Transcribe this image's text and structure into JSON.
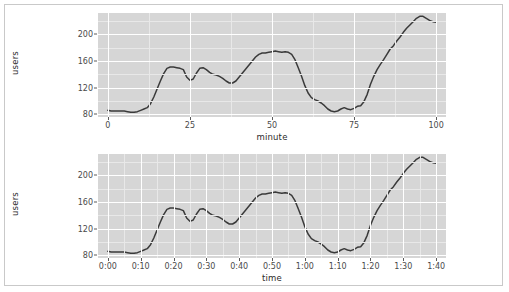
{
  "figure": {
    "background_color": "#ffffff",
    "border_color": "#c9c9c9",
    "panel_color": "#d6d6d6",
    "grid_major_color": "#ffffff",
    "grid_minor_color": "#e8e8e8",
    "line_color": "#3a3a3a"
  },
  "chart_data": [
    {
      "type": "line",
      "title": "",
      "xlabel": "minute",
      "ylabel": "users",
      "xlim": [
        -3,
        103
      ],
      "ylim": [
        76,
        232
      ],
      "grid": true,
      "legend": "none",
      "xticks": [
        "0",
        "25",
        "50",
        "75",
        "100"
      ],
      "xtick_values": [
        0,
        25,
        50,
        75,
        100
      ],
      "yticks": [
        "80",
        "120",
        "160",
        "200"
      ],
      "ytick_values": [
        80,
        120,
        160,
        200
      ],
      "series": [
        {
          "name": "users",
          "color": "#3a3a3a",
          "x": [
            0,
            1,
            2,
            3,
            4,
            5,
            6,
            7,
            8,
            9,
            10,
            11,
            12,
            13,
            14,
            15,
            16,
            17,
            18,
            19,
            20,
            21,
            22,
            23,
            24,
            25,
            26,
            27,
            28,
            29,
            30,
            31,
            32,
            33,
            34,
            35,
            36,
            37,
            38,
            39,
            40,
            41,
            42,
            43,
            44,
            45,
            46,
            47,
            48,
            49,
            50,
            51,
            52,
            53,
            54,
            55,
            56,
            57,
            58,
            59,
            60,
            61,
            62,
            63,
            64,
            65,
            66,
            67,
            68,
            69,
            70,
            71,
            72,
            73,
            74,
            75,
            76,
            77,
            78,
            79,
            80,
            81,
            82,
            83,
            84,
            85,
            86,
            87,
            88,
            89,
            90,
            91,
            92,
            93,
            94,
            95,
            96,
            97,
            98,
            99,
            100
          ],
          "y": [
            86,
            85,
            85,
            85,
            85,
            85,
            84,
            83,
            83,
            84,
            86,
            88,
            90,
            96,
            106,
            118,
            130,
            141,
            149,
            151,
            151,
            150,
            149,
            147,
            136,
            131,
            133,
            142,
            149,
            150,
            147,
            143,
            140,
            139,
            137,
            134,
            130,
            127,
            127,
            130,
            136,
            142,
            148,
            154,
            160,
            166,
            170,
            172,
            172,
            173,
            174,
            175,
            174,
            173,
            174,
            173,
            170,
            162,
            150,
            137,
            123,
            112,
            105,
            102,
            100,
            97,
            93,
            88,
            85,
            84,
            85,
            88,
            90,
            88,
            87,
            89,
            92,
            93,
            99,
            110,
            125,
            137,
            147,
            155,
            162,
            170,
            178,
            183,
            190,
            196,
            203,
            209,
            214,
            219,
            224,
            227,
            227,
            224,
            221,
            219,
            218
          ]
        }
      ]
    },
    {
      "type": "line",
      "title": "",
      "xlabel": "time",
      "ylabel": "users",
      "xlim": [
        -3,
        103
      ],
      "ylim": [
        76,
        232
      ],
      "grid": true,
      "legend": "none",
      "xticks": [
        "0:00",
        "0:10",
        "0:20",
        "0:30",
        "0:40",
        "0:50",
        "1:00",
        "1:10",
        "1:20",
        "1:30",
        "1:40"
      ],
      "xtick_values": [
        0,
        10,
        20,
        30,
        40,
        50,
        60,
        70,
        80,
        90,
        100
      ],
      "yticks": [
        "80",
        "120",
        "160",
        "200"
      ],
      "ytick_values": [
        80,
        120,
        160,
        200
      ],
      "series": [
        {
          "name": "users",
          "color": "#3a3a3a",
          "x": [
            0,
            1,
            2,
            3,
            4,
            5,
            6,
            7,
            8,
            9,
            10,
            11,
            12,
            13,
            14,
            15,
            16,
            17,
            18,
            19,
            20,
            21,
            22,
            23,
            24,
            25,
            26,
            27,
            28,
            29,
            30,
            31,
            32,
            33,
            34,
            35,
            36,
            37,
            38,
            39,
            40,
            41,
            42,
            43,
            44,
            45,
            46,
            47,
            48,
            49,
            50,
            51,
            52,
            53,
            54,
            55,
            56,
            57,
            58,
            59,
            60,
            61,
            62,
            63,
            64,
            65,
            66,
            67,
            68,
            69,
            70,
            71,
            72,
            73,
            74,
            75,
            76,
            77,
            78,
            79,
            80,
            81,
            82,
            83,
            84,
            85,
            86,
            87,
            88,
            89,
            90,
            91,
            92,
            93,
            94,
            95,
            96,
            97,
            98,
            99,
            100
          ],
          "y": [
            86,
            85,
            85,
            85,
            85,
            85,
            84,
            83,
            83,
            84,
            86,
            88,
            90,
            96,
            106,
            118,
            130,
            141,
            149,
            151,
            151,
            150,
            149,
            147,
            136,
            131,
            133,
            142,
            149,
            150,
            147,
            143,
            140,
            139,
            137,
            134,
            130,
            127,
            127,
            130,
            136,
            142,
            148,
            154,
            160,
            166,
            170,
            172,
            172,
            173,
            174,
            175,
            174,
            173,
            174,
            173,
            170,
            162,
            150,
            137,
            123,
            112,
            105,
            102,
            100,
            97,
            93,
            88,
            85,
            84,
            85,
            88,
            90,
            88,
            87,
            89,
            92,
            93,
            99,
            110,
            125,
            137,
            147,
            155,
            162,
            170,
            178,
            183,
            190,
            196,
            203,
            209,
            214,
            219,
            224,
            227,
            227,
            224,
            221,
            219,
            218
          ]
        }
      ]
    }
  ]
}
